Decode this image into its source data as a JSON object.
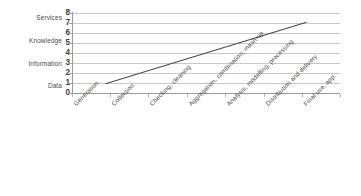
{
  "chart_data": {
    "type": "line",
    "title": "",
    "subtitle": "",
    "xlabel": "",
    "ylabel": "",
    "ylim": [
      0,
      8
    ],
    "yticks": [
      0,
      1,
      2,
      3,
      4,
      5,
      6,
      7,
      8
    ],
    "grid": true,
    "legend": false,
    "legend_position": "none",
    "categories": [
      "Generation",
      "Collection",
      "Checking, cleaning",
      "Aggregation, combination, mash-up",
      "Analysis, modelling, processing",
      "Distribution and delivery",
      "Final use, app"
    ],
    "series": [
      {
        "name": "Value chain",
        "values": [
          1,
          2,
          3,
          4,
          5,
          6,
          7
        ],
        "color": "#4a4a4a"
      }
    ],
    "tier_labels": [
      {
        "label": "Services",
        "y": 7
      },
      {
        "label": "Knowledge",
        "y": 5.5
      },
      {
        "label": "Information",
        "y": 4
      },
      {
        "label": "Data",
        "y": 2
      }
    ],
    "colors": {
      "line": "#4a4a4a",
      "grid": "#c9c9c9",
      "axis": "#9a9a9a",
      "text": "#4a4a4a",
      "background": "#ffffff"
    }
  }
}
